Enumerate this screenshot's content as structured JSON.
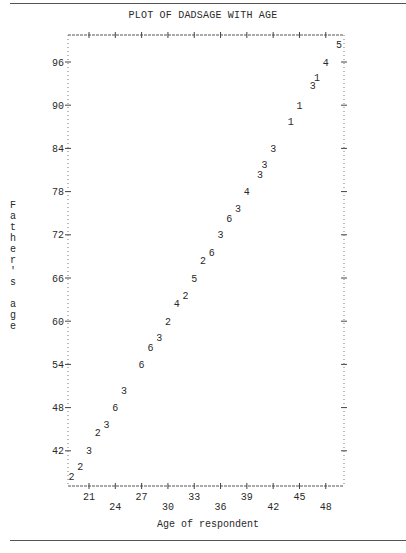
{
  "title": "PLOT OF DADSAGE WITH AGE",
  "ylabel_chars": "F\na\nt\nh\ne\nr\n'\ns\n \na\ng\ne",
  "xlabel": "Age of respondent",
  "chart_data": {
    "type": "scatter",
    "title": "PLOT OF DADSAGE WITH AGE",
    "xlabel": "Age of respondent",
    "ylabel": "Father's age",
    "xlim": [
      18,
      50
    ],
    "ylim": [
      37,
      99
    ],
    "grid": false,
    "legend": "none (plot symbols are observation counts)",
    "x_ticks": [
      21,
      24,
      27,
      30,
      33,
      36,
      39,
      42,
      45,
      48
    ],
    "y_ticks": [
      42,
      48,
      54,
      60,
      66,
      72,
      78,
      84,
      90,
      96
    ],
    "points": [
      {
        "x": 19,
        "y": 38.4,
        "label": "2"
      },
      {
        "x": 20,
        "y": 39.8,
        "label": "2"
      },
      {
        "x": 21,
        "y": 42,
        "label": "3"
      },
      {
        "x": 22,
        "y": 44.5,
        "label": "2"
      },
      {
        "x": 23,
        "y": 45.7,
        "label": "3"
      },
      {
        "x": 24,
        "y": 48,
        "label": "6"
      },
      {
        "x": 25,
        "y": 50.4,
        "label": "3"
      },
      {
        "x": 27,
        "y": 54,
        "label": "6"
      },
      {
        "x": 28,
        "y": 56.4,
        "label": "6"
      },
      {
        "x": 29,
        "y": 57.7,
        "label": "3"
      },
      {
        "x": 30,
        "y": 60,
        "label": "2"
      },
      {
        "x": 31,
        "y": 62.4,
        "label": "4"
      },
      {
        "x": 32,
        "y": 63.6,
        "label": "2"
      },
      {
        "x": 33,
        "y": 66,
        "label": "5"
      },
      {
        "x": 34,
        "y": 68.4,
        "label": "2"
      },
      {
        "x": 35,
        "y": 69.6,
        "label": "6"
      },
      {
        "x": 36,
        "y": 72,
        "label": "3"
      },
      {
        "x": 37,
        "y": 74.3,
        "label": "6"
      },
      {
        "x": 38,
        "y": 75.6,
        "label": "3"
      },
      {
        "x": 39,
        "y": 78,
        "label": "4"
      },
      {
        "x": 40.5,
        "y": 80.4,
        "label": "3"
      },
      {
        "x": 41,
        "y": 81.7,
        "label": "3"
      },
      {
        "x": 42,
        "y": 84,
        "label": "3"
      },
      {
        "x": 44,
        "y": 87.7,
        "label": "1"
      },
      {
        "x": 45,
        "y": 90,
        "label": "1"
      },
      {
        "x": 46.5,
        "y": 92.7,
        "label": "3"
      },
      {
        "x": 47,
        "y": 93.8,
        "label": "1"
      },
      {
        "x": 48,
        "y": 96,
        "label": "4"
      },
      {
        "x": 49.5,
        "y": 98.4,
        "label": "5"
      }
    ]
  }
}
